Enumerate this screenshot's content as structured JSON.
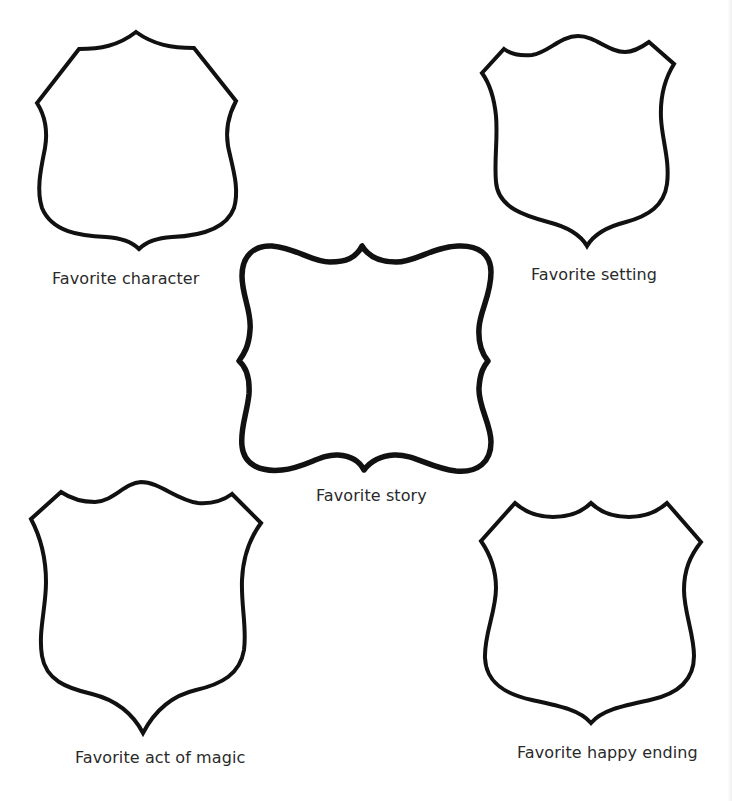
{
  "worksheet": {
    "colors": {
      "background": "#ffffff",
      "outline": "#111111",
      "text": "#2a2a2a"
    },
    "boxes": [
      {
        "id": "character",
        "shape": "shield-pointed-top",
        "label": "Favorite character"
      },
      {
        "id": "setting",
        "shape": "shield-wave-top",
        "label": "Favorite setting"
      },
      {
        "id": "story",
        "shape": "bracket-frame",
        "label": "Favorite story"
      },
      {
        "id": "magic",
        "shape": "shield-wave-top",
        "label": "Favorite act of magic"
      },
      {
        "id": "ending",
        "shape": "shield-double-notch-top",
        "label": "Favorite happy ending"
      }
    ]
  }
}
